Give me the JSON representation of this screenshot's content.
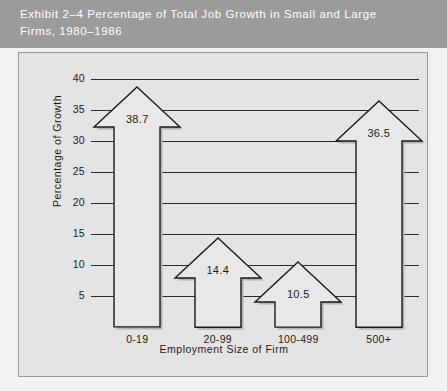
{
  "title": {
    "text": "Exhibit 2–4    Percentage of Total Job Growth in Small and Large\nFirms, 1980–1986",
    "band_color": "#9b9b9b",
    "text_color": "#ffffff"
  },
  "chart_data": {
    "type": "bar",
    "title": "Exhibit 2–4    Percentage of Total Job Growth in Small and Large Firms, 1980–1986",
    "xlabel": "Employment Size of Firm",
    "ylabel": "Percentage of Growth",
    "categories": [
      "0-19",
      "20-99",
      "100-499",
      "500+"
    ],
    "values": [
      38.7,
      14.4,
      10.5,
      36.5
    ],
    "value_labels": [
      "38.7",
      "14.4",
      "10.5",
      "36.5"
    ],
    "ytick_labels": [
      "5",
      "10",
      "15",
      "20",
      "25",
      "30",
      "35",
      "40"
    ],
    "yticks": [
      5,
      10,
      15,
      20,
      25,
      30,
      35,
      40
    ],
    "ylim": [
      0,
      40
    ],
    "grid": "horizontal",
    "legend": "none",
    "marker_style": "up-arrow",
    "bar_fill": "#e8e8e8",
    "bar_outline": "#1a1a1a",
    "plot_background": "#e4e4e4"
  }
}
